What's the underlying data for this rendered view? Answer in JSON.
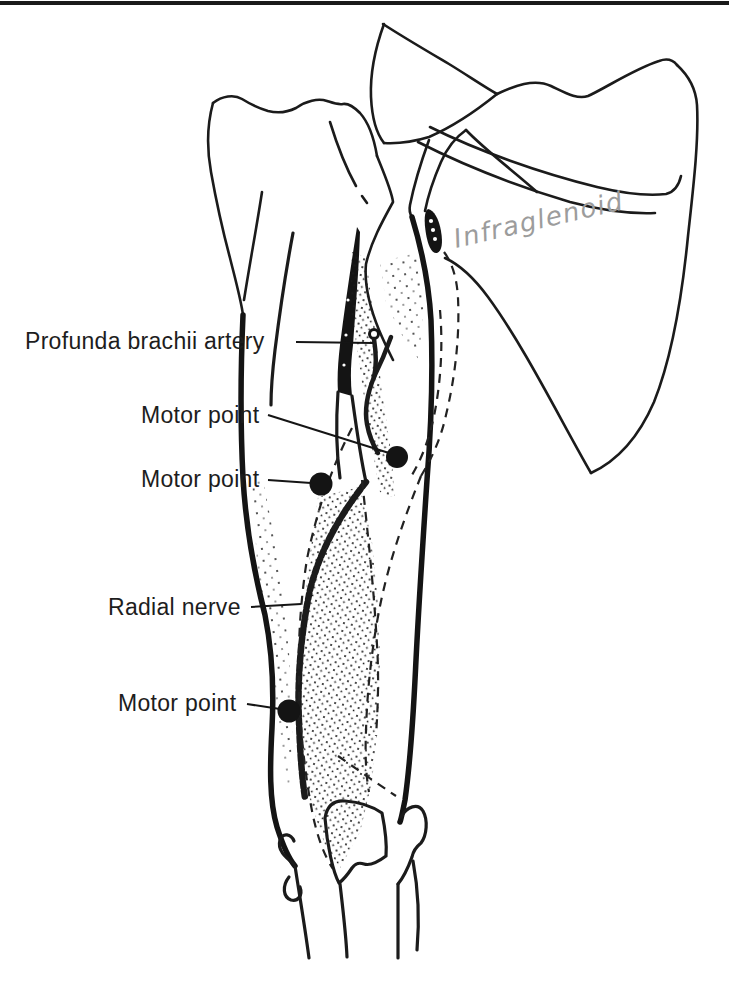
{
  "page": {
    "kind": "scanned textbook anatomical figure",
    "background_color": "#ffffff",
    "top_rule_color": "#1a1a1a",
    "ink_color": "#1b1b1b",
    "pencil_color": "#9c9c9c"
  },
  "figure": {
    "labels": [
      {
        "text": "Profunda brachii artery"
      },
      {
        "text": "Motor point"
      },
      {
        "text": "Motor point"
      },
      {
        "text": "Radial nerve"
      },
      {
        "text": "Motor point"
      }
    ],
    "handwritten_annotation": {
      "text": "Infraglenoid"
    },
    "motor_point_count": "3"
  }
}
